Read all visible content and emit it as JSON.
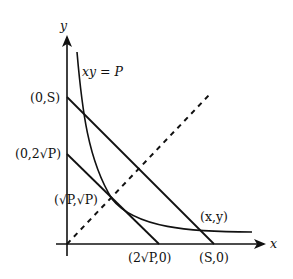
{
  "diagram": {
    "type": "geometry-plot",
    "axes": {
      "x_label": "x",
      "y_label": "y"
    },
    "curve_label": "xy = P",
    "points": {
      "y_intercept_S": "(0,S)",
      "y_intercept_2rootP": "(0,2√P)",
      "tangent_point": "(√P,√P)",
      "curve_point": "(x,y)",
      "x_intercept_2rootP": "(2√P,0)",
      "x_intercept_S": "(S,0)"
    },
    "elements": [
      "hyperbola xy = P",
      "line from (0,S) to (S,0)",
      "tangent line from (0,2√P) to (2√P,0)",
      "dashed line y = x"
    ],
    "colors": {
      "stroke": "#111111",
      "background": "#ffffff"
    }
  }
}
